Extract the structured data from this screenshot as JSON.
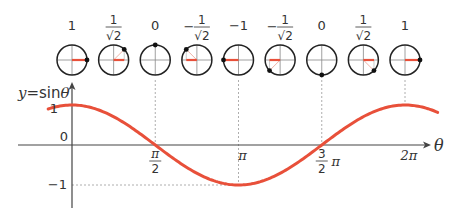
{
  "title": "y=sinθ",
  "title_parts": {
    "y": "y",
    "eq": "=sin",
    "theta": "θ"
  },
  "axis": {
    "x_label": "θ",
    "y_tick_1": "1",
    "y_tick_0": "0",
    "y_tick_neg1": "−1"
  },
  "x_ticks": [
    {
      "value": 1.5708,
      "num": "π",
      "den": "2",
      "type": "frac"
    },
    {
      "value": 3.1416,
      "label": "π",
      "type": "simple"
    },
    {
      "value": 4.7124,
      "num": "3",
      "den": "2",
      "suffix": "π",
      "type": "frac"
    },
    {
      "value": 6.2832,
      "label": "2π",
      "type": "simple"
    }
  ],
  "colors": {
    "curve": "#e8503a",
    "axis": "#444444",
    "guide": "#999999",
    "circle": "#222222"
  },
  "circles": [
    {
      "angle_deg": 0,
      "label": "1",
      "sign": "",
      "frac": false
    },
    {
      "angle_deg": 45,
      "label": "1",
      "den": "√2",
      "sign": "",
      "frac": true
    },
    {
      "angle_deg": 90,
      "label": "0",
      "sign": "",
      "frac": false
    },
    {
      "angle_deg": 135,
      "label": "1",
      "den": "√2",
      "sign": "−",
      "frac": true
    },
    {
      "angle_deg": 180,
      "label": "−1",
      "sign": "",
      "frac": false
    },
    {
      "angle_deg": 225,
      "label": "1",
      "den": "√2",
      "sign": "−",
      "frac": true
    },
    {
      "angle_deg": 270,
      "label": "0",
      "sign": "",
      "frac": false
    },
    {
      "angle_deg": 315,
      "label": "1",
      "den": "√2",
      "sign": "",
      "frac": true
    },
    {
      "angle_deg": 360,
      "label": "1",
      "sign": "",
      "frac": false
    }
  ],
  "chart_data": {
    "type": "line",
    "title": "y=sinθ",
    "xlabel": "θ",
    "ylabel": "y",
    "function": "cos",
    "x_range": [
      -0.45,
      6.9
    ],
    "ylim": [
      -1,
      1
    ],
    "x_ticks": [
      "π/2",
      "π",
      "3/2 π",
      "2π"
    ],
    "y_ticks": [
      "1",
      "0",
      "−1"
    ],
    "series": [
      {
        "name": "curve",
        "x": [
          -0.45,
          0,
          1.5708,
          3.1416,
          4.7124,
          6.2832,
          6.9
        ],
        "values": [
          0.9,
          1,
          0,
          -1,
          0,
          1,
          0.82
        ]
      }
    ]
  }
}
